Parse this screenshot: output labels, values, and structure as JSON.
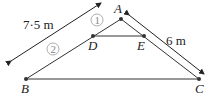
{
  "diagram": {
    "points": {
      "A": {
        "label": "A",
        "x": 121,
        "y": 19
      },
      "B": {
        "label": "B",
        "x": 26,
        "y": 79
      },
      "C": {
        "label": "C",
        "x": 199,
        "y": 79
      },
      "D": {
        "label": "D",
        "x": 93,
        "y": 36
      },
      "E": {
        "label": "E",
        "x": 144,
        "y": 36
      }
    },
    "segments": [
      "AB",
      "AC",
      "DE",
      "BC"
    ],
    "measurements": {
      "left": "7·5 m",
      "right": "6 m"
    },
    "circled_labels": {
      "one": "1",
      "two": "2"
    },
    "colors": {
      "line": "#333333",
      "point": "#333333",
      "circle": "#999999",
      "text": "#222222"
    }
  }
}
